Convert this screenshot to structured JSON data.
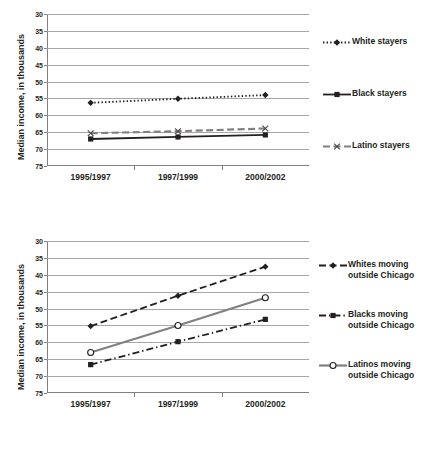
{
  "chart_data": [
    {
      "type": "line",
      "title": "",
      "xlabel": "",
      "ylabel": "Median income, in thousands",
      "categories": [
        "1995/1997",
        "1997/1999",
        "2000/2002"
      ],
      "ylim": [
        30,
        75
      ],
      "yticks": [
        30,
        35,
        40,
        45,
        50,
        55,
        60,
        65,
        70,
        75
      ],
      "grid": true,
      "legend_position": "right",
      "series": [
        {
          "name": "White stayers",
          "values": [
            48.7,
            49.9,
            51.0
          ],
          "line_style": "dotted",
          "marker": "diamond",
          "color": "#231f20"
        },
        {
          "name": "Black stayers",
          "values": [
            38.0,
            38.6,
            39.2
          ],
          "line_style": "solid",
          "marker": "square",
          "color": "#231f20"
        },
        {
          "name": "Latino stayers",
          "values": [
            39.7,
            40.3,
            41.1
          ],
          "line_style": "dashed",
          "marker": "x",
          "color": "#808080"
        }
      ]
    },
    {
      "type": "line",
      "title": "",
      "xlabel": "",
      "ylabel": "Median income, in thousands",
      "categories": [
        "1995/1997",
        "1997/1999",
        "2000/2002"
      ],
      "ylim": [
        30,
        75
      ],
      "yticks": [
        30,
        35,
        40,
        45,
        50,
        55,
        60,
        65,
        70,
        75
      ],
      "grid": true,
      "legend_position": "right",
      "series": [
        {
          "name": "Whites moving\noutside Chicago",
          "values": [
            49.8,
            58.8,
            67.4
          ],
          "line_style": "dashed",
          "marker": "diamond",
          "color": "#231f20"
        },
        {
          "name": "Blacks moving\noutside Chicago",
          "values": [
            38.4,
            45.2,
            51.8
          ],
          "line_style": "dash-dot",
          "marker": "square",
          "color": "#231f20"
        },
        {
          "name": "Latinos moving\noutside Chicago",
          "values": [
            42.0,
            50.0,
            58.2
          ],
          "line_style": "solid",
          "marker": "circle-open",
          "color": "#808080"
        }
      ]
    }
  ],
  "chart1": {
    "ylabel": "Median income, in thousands",
    "yticks": [
      "75",
      "70",
      "65",
      "60",
      "55",
      "50",
      "45",
      "40",
      "35",
      "30"
    ],
    "xticks": [
      "1995/1997",
      "1997/1999",
      "2000/2002"
    ],
    "legend": [
      {
        "label": "White stayers"
      },
      {
        "label": "Black stayers"
      },
      {
        "label": "Latino stayers"
      }
    ]
  },
  "chart2": {
    "ylabel": "Median income, in thousands",
    "yticks": [
      "75",
      "70",
      "65",
      "60",
      "55",
      "50",
      "45",
      "40",
      "35",
      "30"
    ],
    "xticks": [
      "1995/1997",
      "1997/1999",
      "2000/2002"
    ],
    "legend": [
      {
        "label": "Whites moving\noutside Chicago"
      },
      {
        "label": "Blacks moving\noutside Chicago"
      },
      {
        "label": "Latinos moving\noutside Chicago"
      }
    ]
  }
}
